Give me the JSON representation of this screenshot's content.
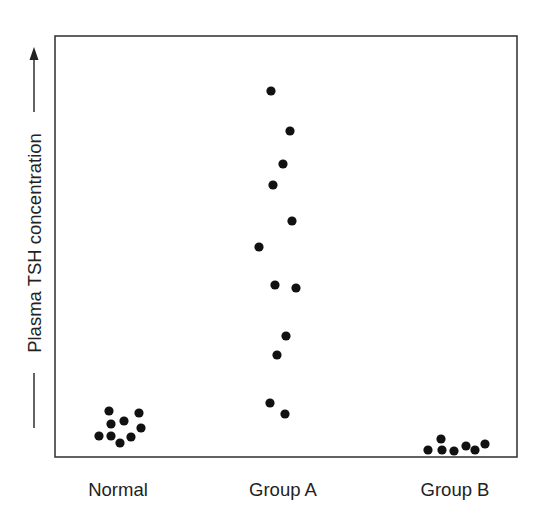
{
  "chart_data": {
    "type": "scatter",
    "subtype": "strip-plot",
    "title": "",
    "xlabel": "",
    "ylabel": "Plasma TSH concentration",
    "ylabel_arrow": "up",
    "y_ticks": "none",
    "grid": false,
    "legend": "none",
    "categories": [
      "Normal",
      "Group A",
      "Group B"
    ],
    "note": "y values are relative (0 = bottom of frame, 100 = top of frame); no numeric scale shown",
    "ylim": [
      0,
      100
    ],
    "series": [
      {
        "name": "Normal",
        "points": [
          {
            "x": 109,
            "y": 411
          },
          {
            "x": 139,
            "y": 413
          },
          {
            "x": 111,
            "y": 424
          },
          {
            "x": 124,
            "y": 421
          },
          {
            "x": 141,
            "y": 428
          },
          {
            "x": 99,
            "y": 436
          },
          {
            "x": 111,
            "y": 436
          },
          {
            "x": 131,
            "y": 437
          },
          {
            "x": 120,
            "y": 443
          }
        ],
        "relative_values": [
          10.9,
          10.5,
          7.8,
          8.6,
          6.9,
          5.0,
          5.0,
          4.8,
          3.3
        ]
      },
      {
        "name": "Group A",
        "points": [
          {
            "x": 271,
            "y": 91
          },
          {
            "x": 290,
            "y": 131
          },
          {
            "x": 283,
            "y": 164
          },
          {
            "x": 273,
            "y": 185
          },
          {
            "x": 292,
            "y": 221
          },
          {
            "x": 259,
            "y": 247
          },
          {
            "x": 275,
            "y": 285
          },
          {
            "x": 296,
            "y": 288
          },
          {
            "x": 286,
            "y": 336
          },
          {
            "x": 277,
            "y": 355
          },
          {
            "x": 270,
            "y": 403
          },
          {
            "x": 285,
            "y": 414
          }
        ],
        "relative_values": [
          86.9,
          77.4,
          69.6,
          64.6,
          56.1,
          49.9,
          40.9,
          40.1,
          28.8,
          24.2,
          12.8,
          10.2
        ]
      },
      {
        "name": "Group B",
        "points": [
          {
            "x": 428,
            "y": 450
          },
          {
            "x": 441,
            "y": 439
          },
          {
            "x": 442,
            "y": 450
          },
          {
            "x": 454,
            "y": 451
          },
          {
            "x": 466,
            "y": 446
          },
          {
            "x": 475,
            "y": 450
          },
          {
            "x": 485,
            "y": 444
          }
        ],
        "relative_values": [
          1.7,
          4.3,
          1.7,
          1.4,
          2.6,
          1.7,
          3.1
        ]
      }
    ],
    "layout": {
      "frame": {
        "x1": 55,
        "y1": 36,
        "x2": 517,
        "y2": 457
      },
      "dot_radius": 4.6,
      "category_label_centers_x": [
        118,
        283,
        455
      ],
      "category_label_baseline_y": 496
    }
  },
  "labels": {
    "y_axis": "Plasma TSH concentration",
    "categories": [
      "Normal",
      "Group A",
      "Group B"
    ]
  },
  "colors": {
    "frame": "#3a3a3a",
    "dots": "#111111",
    "text": "#222222",
    "background": "#ffffff"
  }
}
